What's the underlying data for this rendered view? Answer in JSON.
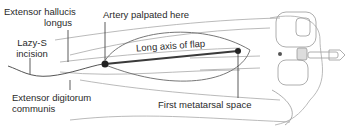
{
  "figure": {
    "labels": {
      "ehl_line1": "Extensor hallucis",
      "ehl_line2": "longus",
      "artery": "Artery palpated here",
      "lazy_line1": "Lazy-S",
      "lazy_line2": "incision",
      "long_axis": "Long axis of flap",
      "edc_line1": "Extensor digitorum",
      "edc_line2": "communis",
      "first_metatarsal": "First metatarsal space"
    },
    "colors": {
      "line": "#9a9a9a",
      "axis": "#3a3a3a",
      "text": "#2a2a2a",
      "dot": "#222222"
    }
  }
}
